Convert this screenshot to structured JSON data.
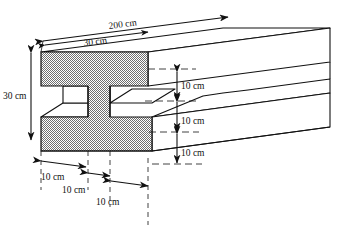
{
  "figure": {
    "units": "cm",
    "stroke_color": "#111111",
    "fill_gray": "#9a9a9a",
    "background": "#ffffff"
  },
  "labels": {
    "length": "200 cm",
    "flange_width": "30 cm",
    "total_height": "30 cm",
    "top_flange_thickness": "10 cm",
    "web_height": "10 cm",
    "bottom_flange_thickness": "10 cm",
    "left_segment": "10 cm",
    "middle_segment": "10 cm",
    "right_segment": "10 cm"
  },
  "geometry_data": {
    "type": "isometric-engineering-drawing",
    "object": "I-beam",
    "overall_length_cm": 200,
    "flange_width_cm": 30,
    "overall_height_cm": 30,
    "top_flange_thickness_cm": 10,
    "web_height_cm": 10,
    "bottom_flange_thickness_cm": 10,
    "width_segments_cm": [
      10,
      10,
      10
    ],
    "height_segments_cm": [
      10,
      10,
      10
    ]
  }
}
